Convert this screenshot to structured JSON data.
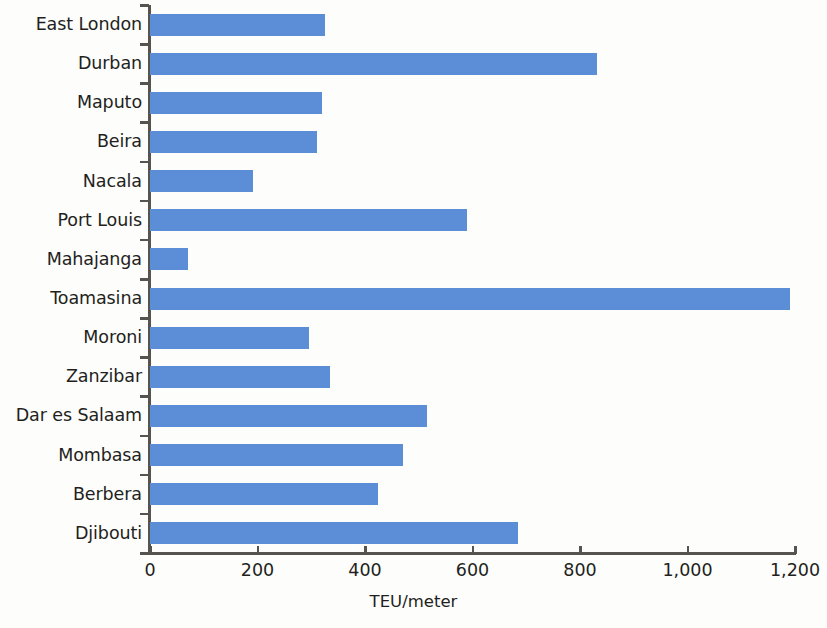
{
  "chart_data": {
    "type": "bar",
    "orientation": "horizontal",
    "title": "",
    "subtitle": "",
    "xlabel": "TEU/meter",
    "ylabel": "",
    "xlim": [
      0,
      1200
    ],
    "xticks": [
      0,
      200,
      400,
      600,
      800,
      1000,
      1200
    ],
    "xtick_labels": [
      "0",
      "200",
      "400",
      "600",
      "800",
      "1,000",
      "1,200"
    ],
    "grid": false,
    "legend": null,
    "bar_color": "#5b8ed6",
    "axis_color": "#57544f",
    "text_color": "#231f20",
    "categories": [
      "East London",
      "Durban",
      "Maputo",
      "Beira",
      "Nacala",
      "Port Louis",
      "Mahajanga",
      "Toamasina",
      "Moroni",
      "Zanzibar",
      "Dar es Salaam",
      "Mombasa",
      "Berbera",
      "Djibouti"
    ],
    "values": [
      326,
      832,
      320,
      310,
      192,
      590,
      70,
      1190,
      295,
      335,
      515,
      470,
      425,
      685
    ],
    "series": [
      {
        "name": "TEU/meter",
        "values": [
          326,
          832,
          320,
          310,
          192,
          590,
          70,
          1190,
          295,
          335,
          515,
          470,
          425,
          685
        ]
      }
    ]
  }
}
